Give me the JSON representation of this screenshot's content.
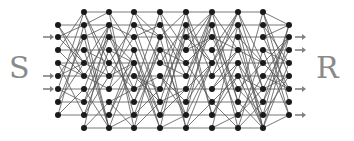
{
  "labels": {
    "source": "S",
    "sink": "R"
  },
  "colors": {
    "node": "#1a1a1a",
    "edge": "#555555",
    "arrow": "#808080",
    "label": "#8a8a8a"
  },
  "network": {
    "columns_x": [
      58,
      84,
      109,
      134,
      160,
      186,
      212,
      238,
      263,
      289
    ],
    "node_counts": [
      8,
      10,
      10,
      10,
      10,
      10,
      10,
      10,
      10,
      8
    ],
    "rows_10": [
      12,
      25,
      37,
      50,
      63,
      76,
      89,
      102,
      115,
      128
    ],
    "rows_8": [
      25,
      37,
      50,
      63,
      76,
      89,
      102,
      115
    ],
    "input_arrow_rows": [
      37,
      76,
      89
    ],
    "output_arrow_rows": [
      37,
      50,
      89,
      115
    ]
  }
}
